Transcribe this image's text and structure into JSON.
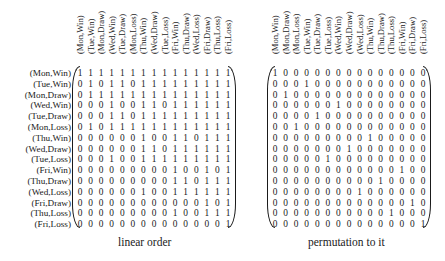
{
  "left": {
    "caption": "linear order",
    "col_labels": [
      "(Mon,Win)",
      "(Tue,Win)",
      "(Mon,Draw)",
      "(Wed,Win)",
      "(Tue,Draw)",
      "(Mon,Loss)",
      "(Thu,Win)",
      "(Wed,Draw)",
      "(Tue,Loss)",
      "(Fri,Win)",
      "(Thu,Draw)",
      "(Wed,Loss)",
      "(Fri,Draw)",
      "(Thu,Loss)",
      "(Fri,Loss)"
    ],
    "row_labels": [
      "(Mon,Win)",
      "(Tue,Win)",
      "(Mon,Draw)",
      "(Wed,Win)",
      "(Tue,Draw)",
      "(Mon,Loss)",
      "(Thu,Win)",
      "(Wed,Draw)",
      "(Tue,Loss)",
      "(Fri,Win)",
      "(Thu,Draw)",
      "(Wed,Loss)",
      "(Fri,Draw)",
      "(Thu,Loss)",
      "(Fri,Loss)"
    ],
    "matrix": [
      [
        1,
        1,
        1,
        1,
        1,
        1,
        1,
        1,
        1,
        1,
        1,
        1,
        1,
        1,
        1
      ],
      [
        0,
        1,
        0,
        1,
        1,
        0,
        1,
        1,
        1,
        1,
        1,
        1,
        1,
        1,
        1
      ],
      [
        0,
        1,
        1,
        1,
        1,
        1,
        1,
        1,
        1,
        1,
        1,
        1,
        1,
        1,
        1
      ],
      [
        0,
        0,
        0,
        1,
        0,
        0,
        1,
        1,
        0,
        1,
        1,
        1,
        1,
        1,
        1
      ],
      [
        0,
        0,
        0,
        1,
        1,
        0,
        1,
        1,
        1,
        1,
        1,
        1,
        1,
        1,
        1
      ],
      [
        0,
        1,
        0,
        1,
        1,
        1,
        1,
        1,
        1,
        1,
        1,
        1,
        1,
        1,
        1
      ],
      [
        0,
        0,
        0,
        0,
        0,
        0,
        1,
        0,
        0,
        1,
        1,
        0,
        1,
        1,
        1
      ],
      [
        0,
        0,
        0,
        0,
        0,
        0,
        1,
        1,
        0,
        1,
        1,
        1,
        1,
        1,
        1
      ],
      [
        0,
        0,
        0,
        1,
        0,
        0,
        1,
        1,
        1,
        1,
        1,
        1,
        1,
        1,
        1
      ],
      [
        0,
        0,
        0,
        0,
        0,
        0,
        0,
        0,
        0,
        1,
        0,
        0,
        1,
        0,
        1
      ],
      [
        0,
        0,
        0,
        0,
        0,
        0,
        0,
        0,
        0,
        1,
        1,
        0,
        1,
        1,
        1
      ],
      [
        0,
        0,
        0,
        0,
        0,
        0,
        1,
        0,
        0,
        1,
        1,
        1,
        1,
        1,
        1
      ],
      [
        0,
        0,
        0,
        0,
        0,
        0,
        0,
        0,
        0,
        0,
        0,
        0,
        1,
        0,
        1
      ],
      [
        0,
        0,
        0,
        0,
        0,
        0,
        0,
        0,
        0,
        1,
        0,
        0,
        1,
        1,
        1
      ],
      [
        0,
        0,
        0,
        0,
        0,
        0,
        0,
        0,
        0,
        0,
        0,
        0,
        0,
        0,
        1
      ]
    ]
  },
  "right": {
    "caption": "permutation to it",
    "col_labels": [
      "(Mon,Win)",
      "(Mon,Draw)",
      "(Mon,Loss)",
      "(Tue,Win)",
      "(Tue,Draw)",
      "(Tue,Loss)",
      "(Wed,Win)",
      "(Wed,Draw)",
      "(Wed,Loss)",
      "(Thu,Win)",
      "(Thu,Draw)",
      "(Thu,Loss)",
      "(Fri,Win)",
      "(Fri,Draw)",
      "(Fri,Loss)"
    ],
    "matrix": [
      [
        1,
        0,
        0,
        0,
        0,
        0,
        0,
        0,
        0,
        0,
        0,
        0,
        0,
        0,
        0
      ],
      [
        0,
        0,
        0,
        1,
        0,
        0,
        0,
        0,
        0,
        0,
        0,
        0,
        0,
        0,
        0
      ],
      [
        0,
        1,
        0,
        0,
        0,
        0,
        0,
        0,
        0,
        0,
        0,
        0,
        0,
        0,
        0
      ],
      [
        0,
        0,
        0,
        0,
        0,
        0,
        1,
        0,
        0,
        0,
        0,
        0,
        0,
        0,
        0
      ],
      [
        0,
        0,
        0,
        0,
        1,
        0,
        0,
        0,
        0,
        0,
        0,
        0,
        0,
        0,
        0
      ],
      [
        0,
        0,
        1,
        0,
        0,
        0,
        0,
        0,
        0,
        0,
        0,
        0,
        0,
        0,
        0
      ],
      [
        0,
        0,
        0,
        0,
        0,
        0,
        0,
        0,
        0,
        1,
        0,
        0,
        0,
        0,
        0
      ],
      [
        0,
        0,
        0,
        0,
        0,
        0,
        0,
        1,
        0,
        0,
        0,
        0,
        0,
        0,
        0
      ],
      [
        0,
        0,
        0,
        0,
        0,
        1,
        0,
        0,
        0,
        0,
        0,
        0,
        0,
        0,
        0
      ],
      [
        0,
        0,
        0,
        0,
        0,
        0,
        0,
        0,
        0,
        0,
        0,
        0,
        1,
        0,
        0
      ],
      [
        0,
        0,
        0,
        0,
        0,
        0,
        0,
        0,
        0,
        0,
        1,
        0,
        0,
        0,
        0
      ],
      [
        0,
        0,
        0,
        0,
        0,
        0,
        0,
        0,
        1,
        0,
        0,
        0,
        0,
        0,
        0
      ],
      [
        0,
        0,
        0,
        0,
        0,
        0,
        0,
        0,
        0,
        0,
        0,
        0,
        0,
        1,
        0
      ],
      [
        0,
        0,
        0,
        0,
        0,
        0,
        0,
        0,
        0,
        0,
        0,
        1,
        0,
        0,
        0
      ],
      [
        0,
        0,
        0,
        0,
        0,
        0,
        0,
        0,
        0,
        0,
        0,
        0,
        0,
        0,
        1
      ]
    ]
  }
}
